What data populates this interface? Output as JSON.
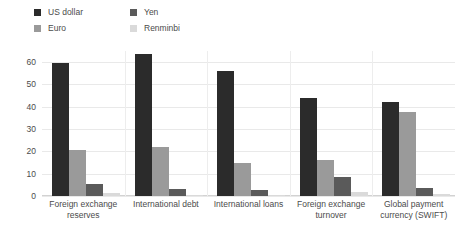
{
  "chart_data": {
    "type": "bar",
    "title": "",
    "subtitle": "",
    "xlabel": "",
    "ylabel": "",
    "ylim": [
      0,
      65
    ],
    "yticks": [
      0,
      10,
      20,
      30,
      40,
      50,
      60
    ],
    "grid": true,
    "legend_position": "top-left",
    "categories": [
      "Foreign exchange reserves",
      "International debt",
      "International loans",
      "Foreign exchange turnover",
      "Global payment currency (SWIFT)"
    ],
    "series": [
      {
        "name": "US dollar",
        "color": "#2b2b2b",
        "values": [
          59.5,
          63.5,
          56.0,
          44.0,
          42.0
        ]
      },
      {
        "name": "Euro",
        "color": "#9a9a9a",
        "values": [
          20.5,
          22.0,
          15.0,
          16.0,
          37.5
        ]
      },
      {
        "name": "Yen",
        "color": "#5a5a5a",
        "values": [
          5.5,
          3.0,
          2.5,
          8.5,
          3.5
        ]
      },
      {
        "name": "Renminbi",
        "color": "#dadada",
        "values": [
          1.5,
          0.6,
          0.4,
          2.0,
          1.0
        ]
      }
    ]
  },
  "legend": {
    "items": [
      {
        "label": "US dollar",
        "color": "#2b2b2b"
      },
      {
        "label": "Yen",
        "color": "#5a5a5a"
      },
      {
        "label": "Euro",
        "color": "#9a9a9a"
      },
      {
        "label": "Renminbi",
        "color": "#dadada"
      }
    ]
  },
  "yaxis": {
    "ticks": [
      "0",
      "10",
      "20",
      "30",
      "40",
      "50",
      "60"
    ]
  },
  "xaxis": {
    "labels": [
      "Foreign exchange reserves",
      "International debt",
      "International loans",
      "Foreign exchange turnover",
      "Global payment currency (SWIFT)"
    ]
  }
}
